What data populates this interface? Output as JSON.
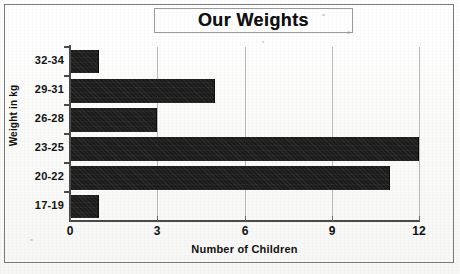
{
  "chart_data": {
    "type": "bar",
    "orientation": "horizontal",
    "title": "Our Weights",
    "xlabel": "Number of Children",
    "ylabel": "Weight in kg",
    "categories": [
      "17-19",
      "20-22",
      "23-25",
      "26-28",
      "29-31",
      "32-34"
    ],
    "values": [
      1,
      11,
      12,
      3,
      5,
      1
    ],
    "xticks": [
      0,
      3,
      6,
      9,
      12
    ],
    "xtick_labels": [
      "0",
      "3",
      "6",
      "9",
      "12"
    ],
    "xlim": [
      0,
      12
    ],
    "grid": "vertical",
    "legend": "none",
    "bar_color": "#1c1c1c",
    "gridline_color": "#b9b9b9",
    "axis_color": "#4a4a4a",
    "background_color": "#fdfdfc"
  },
  "frame": {
    "border_color": "#7a7a7a"
  }
}
